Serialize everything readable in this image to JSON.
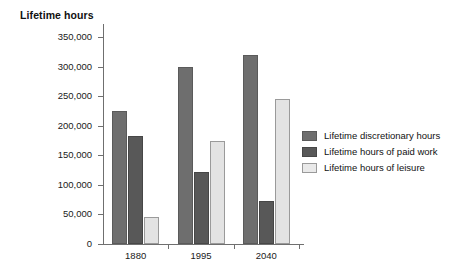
{
  "chart_data": {
    "type": "bar",
    "title": "",
    "xlabel": "",
    "ylabel": "Lifetime hours",
    "categories": [
      "1880",
      "1995",
      "2040"
    ],
    "series": [
      {
        "name": "Lifetime discretionary hours",
        "color": "#6e6e6e",
        "values": [
          225000,
          300000,
          320000
        ]
      },
      {
        "name": "Lifetime hours of paid work",
        "color": "#585858",
        "values": [
          183000,
          121000,
          73000
        ]
      },
      {
        "name": "Lifetime hours of leisure",
        "color": "#e3e3e3",
        "values": [
          45000,
          175000,
          245000
        ]
      }
    ],
    "ylim": [
      0,
      350000
    ],
    "yticks": [
      0,
      50000,
      100000,
      150000,
      200000,
      250000,
      300000,
      350000
    ],
    "ytick_labels": [
      "0",
      "50,000",
      "100,000",
      "150,000",
      "200,000",
      "250,000",
      "300,000",
      "350,000"
    ],
    "grid": false,
    "legend_position": "right"
  }
}
